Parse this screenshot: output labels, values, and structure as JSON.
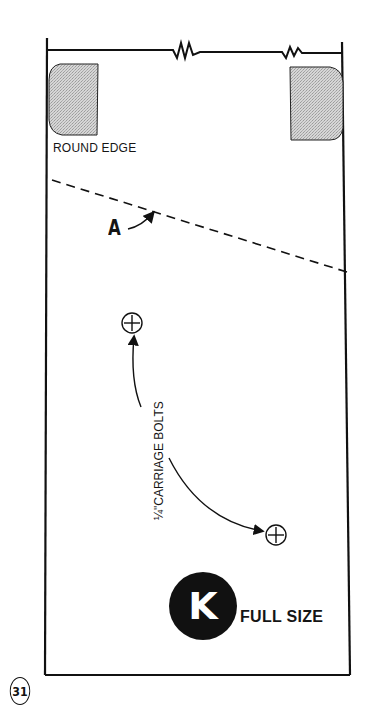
{
  "diagram": {
    "type": "woodworking template",
    "labels": {
      "round_edge": "ROUND EDGE",
      "cut_line": "A",
      "bolts": "¼\"CARRIAGE BOLTS",
      "part_letter": "K",
      "scale": "FULL SIZE",
      "page_number": "31"
    },
    "elements": {
      "break_symbols": 2,
      "shaded_corners": [
        "left",
        "right"
      ],
      "dashed_line": "A",
      "bolt_holes": 2
    }
  }
}
